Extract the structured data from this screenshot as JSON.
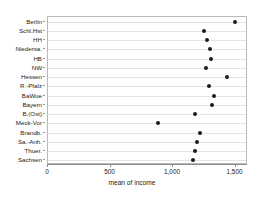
{
  "chart_data": {
    "type": "scatter",
    "title": "",
    "subtitle": "",
    "xlabel": "mean of income",
    "ylabel": "",
    "orientation": "horizontal",
    "grid": true,
    "legend": null,
    "xlim": [
      0,
      1600
    ],
    "xticks": [
      0,
      500,
      1000,
      1500
    ],
    "xticklabels": [
      "0",
      "500",
      "1,000",
      "1,500"
    ],
    "categories": [
      "Berlin",
      "Schl.Hst",
      "HH",
      "Niedersa.",
      "HB",
      "NW",
      "Hessen",
      "R.-Pfalz",
      "BaWue",
      "Bayern",
      "B.(Ost)",
      "Meck-Vor",
      "Brandb.",
      "Sa.-Anh.",
      "Thuer.",
      "Sachsen"
    ],
    "values": [
      1492,
      1251,
      1274,
      1297,
      1305,
      1266,
      1429,
      1290,
      1329,
      1313,
      1174,
      880,
      1212,
      1189,
      1174,
      1158
    ],
    "series": [
      {
        "name": "mean of income",
        "values": [
          1492,
          1251,
          1274,
          1297,
          1305,
          1266,
          1429,
          1290,
          1329,
          1313,
          1174,
          880,
          1212,
          1189,
          1174,
          1158
        ]
      }
    ]
  },
  "colors": {
    "marker": "#1c1c1c",
    "grid": "#e4e4e4",
    "axis": "#8d8d8d",
    "frame": "#b9b9b9",
    "background": "#ffffff"
  }
}
